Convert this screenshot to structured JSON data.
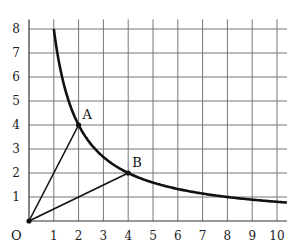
{
  "chart_data": {
    "type": "line",
    "title": "",
    "xlabel": "",
    "ylabel": "",
    "xlim": [
      0,
      10.4
    ],
    "ylim": [
      0,
      8.4
    ],
    "grid": true,
    "origin_label": "O",
    "x_ticks": [
      "1",
      "2",
      "3",
      "4",
      "5",
      "6",
      "7",
      "8",
      "9",
      "10"
    ],
    "y_ticks": [
      "1",
      "2",
      "3",
      "4",
      "5",
      "6",
      "7",
      "8"
    ],
    "series": [
      {
        "name": "y = 8/x",
        "kind": "curve",
        "function": "8/x",
        "x_range": [
          1,
          10.4
        ],
        "color": "#111111"
      },
      {
        "name": "OA",
        "kind": "segment",
        "points": [
          [
            0,
            0
          ],
          [
            2,
            4
          ]
        ],
        "color": "#111111"
      },
      {
        "name": "OB",
        "kind": "segment",
        "points": [
          [
            0,
            0
          ],
          [
            4,
            2
          ]
        ],
        "color": "#111111"
      }
    ],
    "points": [
      {
        "label": "O",
        "x": 0,
        "y": 0
      },
      {
        "label": "A",
        "x": 2,
        "y": 4
      },
      {
        "label": "B",
        "x": 4,
        "y": 2
      }
    ]
  }
}
